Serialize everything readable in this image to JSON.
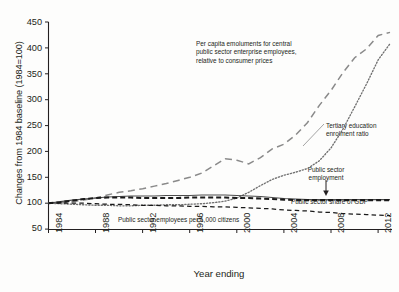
{
  "chart_data": {
    "type": "line",
    "title": "",
    "xlabel": "Year ending",
    "ylabel": "Changes from 1984 baseline (1984=100)",
    "xlim": [
      1984,
      2013
    ],
    "ylim": [
      50,
      450
    ],
    "grid": false,
    "legend_position": "inline-annotations",
    "xticks": [
      "1984",
      "1988",
      "1992",
      "1996",
      "2000",
      "2004",
      "2008",
      "2012"
    ],
    "xtick_values": [
      1984,
      1988,
      1992,
      1996,
      2000,
      2004,
      2008,
      2012
    ],
    "yticks": [
      "50",
      "100",
      "150",
      "200",
      "250",
      "300",
      "350",
      "400",
      "450"
    ],
    "ytick_values": [
      50,
      100,
      150,
      200,
      250,
      300,
      350,
      400,
      450
    ],
    "x": [
      1984,
      1985,
      1986,
      1987,
      1988,
      1989,
      1990,
      1991,
      1992,
      1993,
      1994,
      1995,
      1996,
      1997,
      1998,
      1999,
      2000,
      2001,
      2002,
      2003,
      2004,
      2005,
      2006,
      2007,
      2008,
      2009,
      2010,
      2011,
      2012,
      2013
    ],
    "series": [
      {
        "name": "Per capita emoluments for central public sector enterprise employees, relative to consumer prices",
        "style": "long-dashed",
        "color": "#8a8a8a",
        "values": [
          100,
          101,
          103,
          106,
          110,
          116,
          121,
          124,
          128,
          133,
          138,
          144,
          150,
          158,
          172,
          186,
          183,
          176,
          188,
          205,
          214,
          232,
          256,
          289,
          318,
          352,
          381,
          398,
          424,
          430
        ]
      },
      {
        "name": "Tertiary education enrolment ratio",
        "style": "dotted",
        "color": "#6f6f6f",
        "values": [
          100,
          99,
          98,
          97,
          96,
          96,
          95,
          95,
          96,
          96,
          97,
          97,
          98,
          99,
          101,
          104,
          110,
          121,
          134,
          146,
          154,
          160,
          167,
          182,
          207,
          243,
          286,
          330,
          377,
          408
        ]
      },
      {
        "name": "Public sector employment",
        "style": "solid",
        "color": "#4d4d4d",
        "values": [
          100,
          103,
          106,
          108,
          110,
          112,
          113,
          114,
          114,
          114,
          115,
          115,
          115,
          116,
          116,
          116,
          115,
          114,
          113,
          111,
          109,
          108,
          107,
          107,
          107,
          107,
          107,
          107,
          107,
          107
        ]
      },
      {
        "name": "Public sector share of GDP",
        "style": "dashed-thick",
        "color": "#1a1a1a",
        "values": [
          100,
          102,
          105,
          108,
          110,
          111,
          111,
          111,
          110,
          110,
          110,
          110,
          111,
          111,
          111,
          111,
          110,
          110,
          109,
          108,
          107,
          106,
          106,
          106,
          106,
          106,
          106,
          106,
          106,
          106
        ]
      },
      {
        "name": "Public sector employees per 1,000 citizens",
        "style": "dashed-thin",
        "color": "#1a1a1a",
        "values": [
          100,
          100,
          100,
          100,
          99,
          98,
          98,
          97,
          96,
          96,
          95,
          95,
          94,
          94,
          93,
          93,
          92,
          91,
          90,
          89,
          87,
          86,
          85,
          83,
          82,
          80,
          79,
          78,
          77,
          76
        ]
      }
    ],
    "annotations": [
      {
        "id": "emoluments",
        "text": "Per capita emoluments for central\npublic sector enterprise employees,\nrelative to consumer prices",
        "align": "left"
      },
      {
        "id": "tertiary",
        "text": "Tertiary education\nenrolment ratio",
        "align": "left"
      },
      {
        "id": "employment",
        "text": "Public sector\nemployment",
        "align": "center"
      },
      {
        "id": "gdp-share",
        "text": "Public sector share of GDP",
        "align": "left"
      },
      {
        "id": "per-1000",
        "text": "Public sector employees per 1,000 citizens",
        "align": "left"
      }
    ]
  }
}
